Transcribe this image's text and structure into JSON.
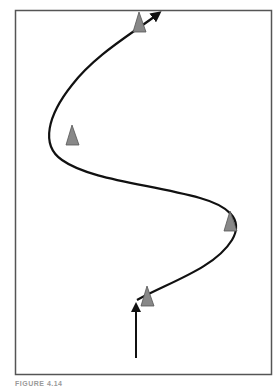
{
  "figure": {
    "caption": "FIGURE 4.14",
    "border_color": "#555555",
    "path_color": "#111111",
    "cone_color": "#888888",
    "cone_outline": "#555555"
  },
  "diagram": {
    "entry_arrow": {
      "from": [
        136,
        358
      ],
      "to": [
        136,
        303
      ]
    },
    "path_start": [
      137,
      299
    ],
    "path_end_arrow": [
      160,
      12
    ],
    "cones": [
      {
        "id": "cone-1",
        "x": 147,
        "y": 297
      },
      {
        "id": "cone-2",
        "x": 231,
        "y": 221
      },
      {
        "id": "cone-3",
        "x": 72,
        "y": 135
      },
      {
        "id": "cone-4",
        "x": 140,
        "y": 22
      }
    ]
  }
}
